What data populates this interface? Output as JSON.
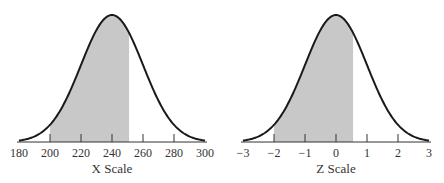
{
  "chart_data": [
    {
      "type": "area",
      "title": "",
      "xlabel": "X Scale",
      "ylabel": "",
      "distribution": "normal",
      "mean": 240,
      "sd": 20,
      "xlim": [
        180,
        300
      ],
      "ticks": [
        180,
        200,
        220,
        240,
        260,
        280,
        300
      ],
      "tick_labels": [
        "180",
        "200",
        "220",
        "240",
        "260",
        "280",
        "300"
      ],
      "shaded_region": [
        200,
        251
      ],
      "grid": false,
      "legend": "none"
    },
    {
      "type": "area",
      "title": "",
      "xlabel": "Z Scale",
      "ylabel": "",
      "distribution": "normal",
      "mean": 0,
      "sd": 1,
      "xlim": [
        -3,
        3
      ],
      "ticks": [
        -3,
        -2,
        -1,
        0,
        1,
        2,
        3
      ],
      "tick_labels": [
        "−3",
        "−2",
        "−1",
        "0",
        "1",
        "2",
        "3"
      ],
      "shaded_region": [
        -2,
        0.55
      ],
      "grid": false,
      "legend": "none"
    }
  ],
  "colors": {
    "curve": "#1a1a1a",
    "shade": "#c8c8c8",
    "axis": "#333333",
    "text": "#333333"
  },
  "layout": [
    {
      "origin_px": 112,
      "px_per_sd": 31,
      "axis_y": 142,
      "peak_y": 15
    },
    {
      "origin_px": 336,
      "px_per_sd": 31,
      "axis_y": 142,
      "peak_y": 15
    }
  ]
}
